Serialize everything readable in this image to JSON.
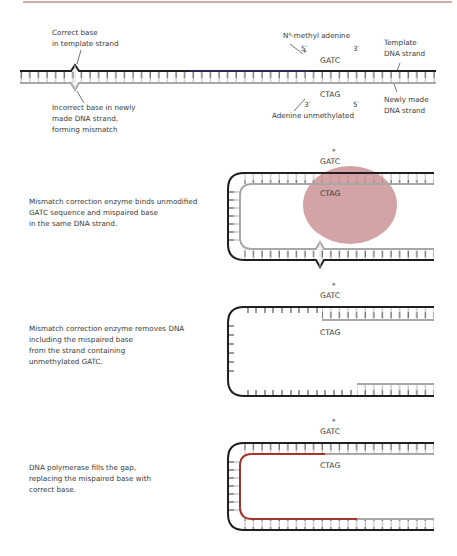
{
  "colors": {
    "top_rule": "#a5564c",
    "template_strand": "#1e1e24",
    "new_strand": "#a8a8a8",
    "enzyme": "#c98f92",
    "new_synth_strand": "#a3362a",
    "text": "#3a3a3a"
  },
  "panel1": {
    "label_correct_base": [
      "Correct base",
      "in template strand"
    ],
    "label_incorrect_base": [
      "Incorrect base in newly",
      "made DNA strand,",
      "forming mismatch"
    ],
    "label_methyl": "N⁶-methyl adenine",
    "label_5prime_top": "5′",
    "label_3prime_top": "3′",
    "seq_top": "GATC",
    "seq_top_star": "*",
    "seq_bottom": "CTAG",
    "label_3prime_bottom": "3′",
    "label_5prime_bottom": "5′",
    "label_unmethylated": "Adenine unmethylated",
    "label_template": [
      "Template",
      "DNA strand"
    ],
    "label_new_strand": [
      "Newly made",
      "DNA strand"
    ]
  },
  "panel2": {
    "caption": [
      "Mismatch correction enzyme binds unmodified",
      "GATC sequence and mispaired base",
      "in the same DNA strand."
    ],
    "seq_top": "GATC",
    "seq_top_star": "*",
    "seq_bottom": "CTAG"
  },
  "panel3": {
    "caption": [
      "Mismatch correction enzyme removes DNA",
      "including the mispaired base",
      "from the strand containing",
      "unmethylated GATC."
    ],
    "seq_top": "GATC",
    "seq_top_star": "*",
    "seq_bottom": "CTAG"
  },
  "panel4": {
    "caption": [
      "DNA polymerase fills the gap,",
      "replacing the mispaired base with",
      "correct base."
    ],
    "seq_top": "GATC",
    "seq_top_star": "*",
    "seq_bottom": "CTAG"
  }
}
